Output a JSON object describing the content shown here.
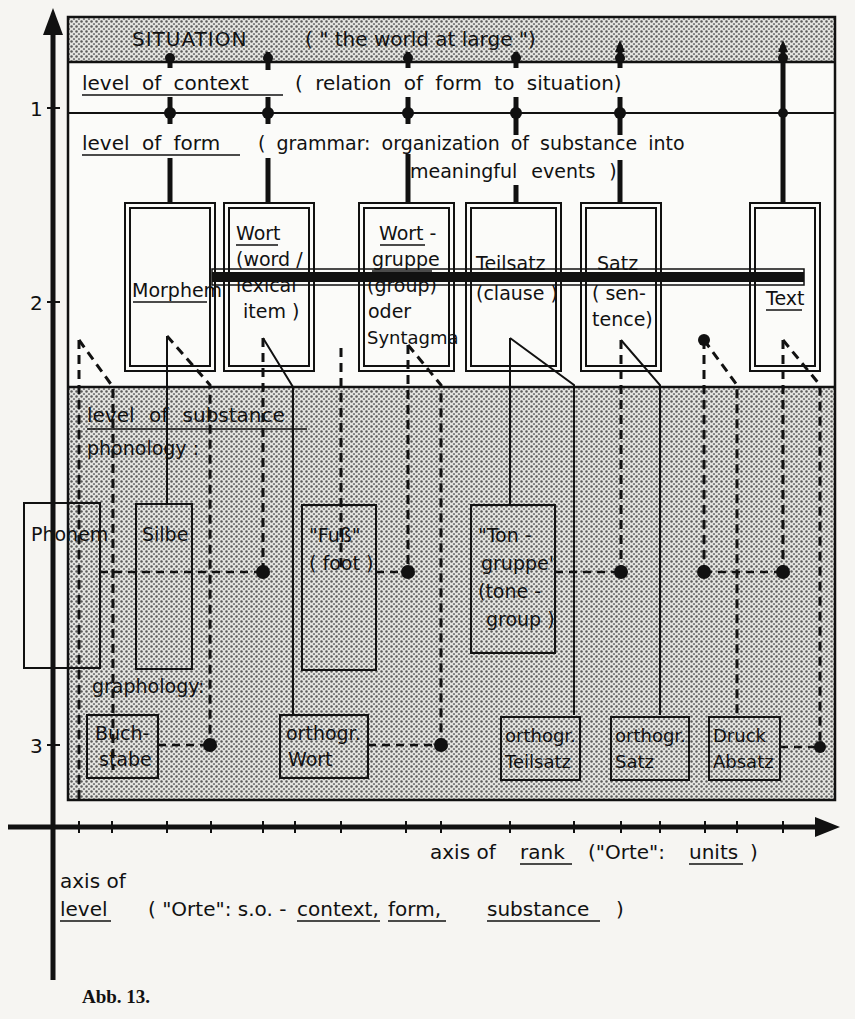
{
  "diagram": {
    "situation": {
      "label": "SITUATION",
      "gloss": "( \" the world at large \")"
    },
    "context_level": {
      "title": "level of context",
      "gloss": "( relation of form to situation)"
    },
    "form_level": {
      "title": "level of form",
      "gloss_line1": "( grammar: organization of substance into",
      "gloss_line2": "meaningful events )"
    },
    "form_units": [
      {
        "id": "morphem",
        "lines": [
          "Morphem"
        ]
      },
      {
        "id": "wort",
        "lines": [
          "Wort",
          "(word /",
          "lexical",
          "item )"
        ]
      },
      {
        "id": "wortgruppe",
        "lines": [
          "Wort -",
          "gruppe",
          "(group)",
          "oder",
          "Syntagma"
        ]
      },
      {
        "id": "teilsatz",
        "lines": [
          "Teilsatz",
          "(clause )"
        ]
      },
      {
        "id": "satz",
        "lines": [
          "Satz",
          "( sen-",
          "tence)"
        ]
      },
      {
        "id": "text",
        "lines": [
          "Text"
        ]
      }
    ],
    "substance_level": {
      "title": "level of substance",
      "phonology_label": "phonology :",
      "graphology_label": "graphology:"
    },
    "phonology_units": [
      {
        "id": "phonem",
        "lines": [
          "Phonem"
        ]
      },
      {
        "id": "silbe",
        "lines": [
          "Silbe"
        ]
      },
      {
        "id": "fuss",
        "lines": [
          "\"Fuß\"",
          "( foot )"
        ]
      },
      {
        "id": "tongruppe",
        "lines": [
          "\"Ton -",
          "gruppe\"",
          "(tone -",
          "group )"
        ]
      }
    ],
    "graphology_units": [
      {
        "id": "buchstabe",
        "lines": [
          "Buch-",
          "stabe"
        ]
      },
      {
        "id": "orthogr-wort",
        "lines": [
          "orthogr.",
          "Wort"
        ]
      },
      {
        "id": "orthogr-teilsatz",
        "lines": [
          "orthogr.",
          "Teilsatz"
        ]
      },
      {
        "id": "orthogr-satz",
        "lines": [
          "orthogr.",
          "Satz"
        ]
      },
      {
        "id": "druck-absatz",
        "lines": [
          "Druck",
          "Absatz"
        ]
      }
    ],
    "y_axis": {
      "ticks": [
        "1",
        "2",
        "3"
      ],
      "label_line1": "axis of",
      "label_line2_underlined": "level",
      "label_line2_rest": "( \"Orte\": s.o. -",
      "terms": [
        "context,",
        "form,",
        "substance"
      ],
      "close": ")"
    },
    "x_axis": {
      "label_pre": "axis of",
      "label_underlined": "rank",
      "label_mid": "(\"Orte\":",
      "label_units": "units",
      "label_close": ")"
    },
    "caption": "Abb. 13."
  }
}
